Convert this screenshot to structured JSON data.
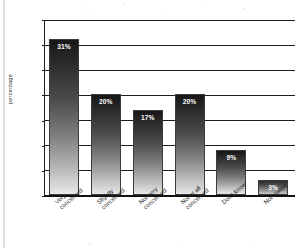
{
  "chart_data": {
    "type": "bar",
    "title": "",
    "xlabel": "",
    "ylabel": "percentage",
    "categories": [
      "Very\nconcerned",
      "Slightly\nconcerned",
      "Not very\nconcerned",
      "Not at all\nconcerned",
      "Don't know",
      "Not stated"
    ],
    "values": [
      31,
      20,
      17,
      20,
      9,
      3
    ],
    "data_labels": [
      "31%",
      "20%",
      "17%",
      "20%",
      "9%",
      "3%"
    ],
    "ylim": [
      0,
      35
    ],
    "ytick_labels": [
      "0",
      "5",
      "10",
      "15",
      "20",
      "25",
      "30",
      "35"
    ],
    "ytick_values": [
      0,
      5,
      10,
      15,
      20,
      25,
      30,
      35
    ],
    "grid": "horizontal",
    "legend": "none",
    "colors": {
      "bar_gradient_top": "#171717",
      "bar_gradient_bottom": "#e8e8e8",
      "bar_outline": "#3b3b3b",
      "axis": "#1d1d1d",
      "gridline": "#1d1d1d",
      "data_label_text": "#ffffff",
      "tick_text": "#2b2b2b",
      "background": "#ffffff"
    }
  }
}
